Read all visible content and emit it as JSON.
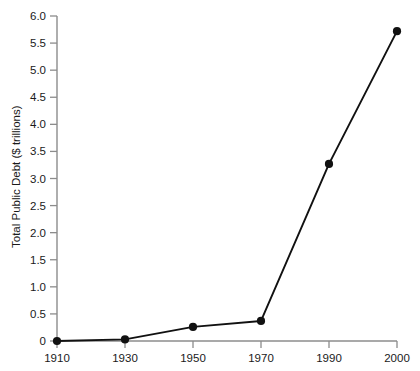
{
  "chart_data": {
    "type": "line",
    "title": "",
    "subtitle": "",
    "xlabel": "",
    "ylabel": "Total Public Debt ($ trillions)",
    "categories": [
      "1910",
      "1930",
      "1950",
      "1970",
      "1990",
      "2000"
    ],
    "values": [
      0.0,
      0.03,
      0.26,
      0.37,
      3.27,
      5.72
    ],
    "series": [
      {
        "name": "Total Public Debt",
        "values": [
          0.0,
          0.03,
          0.26,
          0.37,
          3.27,
          5.72
        ]
      }
    ],
    "x_tick_labels": [
      "1910",
      "1930",
      "1950",
      "1970",
      "1990",
      "2000"
    ],
    "y_tick_labels": [
      "0",
      "0.5",
      "1.0",
      "1.5",
      "2.0",
      "2.5",
      "3.0",
      "3.5",
      "4.0",
      "4.5",
      "5.0",
      "5.5",
      "6.0"
    ],
    "y_tick_values": [
      0,
      0.5,
      1.0,
      1.5,
      2.0,
      2.5,
      3.0,
      3.5,
      4.0,
      4.5,
      5.0,
      5.5,
      6.0
    ],
    "ylim": [
      0,
      6.0
    ],
    "grid": false,
    "legend": false,
    "legend_position": "none",
    "marker": "filled-circle",
    "x_axis_scale": "categorical",
    "colors": {
      "line": "#111111",
      "marker": "#111111",
      "axis": "#8c8c8c",
      "text": "#1a1a1a",
      "background": "#ffffff"
    }
  },
  "axes": {
    "y_title": "Total Public Debt ($ trillions)"
  }
}
